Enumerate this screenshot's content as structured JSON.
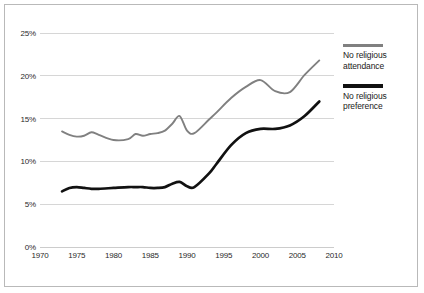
{
  "chart_data": {
    "type": "line",
    "title": "",
    "xlabel": "",
    "ylabel": "",
    "xlim": [
      1970,
      2010
    ],
    "ylim": [
      0,
      25
    ],
    "grid": true,
    "legend_position": "right",
    "x_ticks": [
      "1970",
      "1975",
      "1980",
      "1985",
      "1990",
      "1995",
      "2000",
      "2005",
      "2010"
    ],
    "y_ticks": [
      "0%",
      "5%",
      "10%",
      "15%",
      "20%",
      "25%"
    ],
    "colors": {
      "no_religious_attendance": "#808080",
      "no_religious_preference": "#111111",
      "gridline": "#cccccc",
      "border": "#b9b9b9",
      "background": "#ffffff"
    },
    "x": [
      1973,
      1974,
      1975,
      1976,
      1977,
      1978,
      1980,
      1982,
      1983,
      1984,
      1985,
      1986,
      1987,
      1988,
      1989,
      1990,
      1991,
      1993,
      1994,
      1996,
      1998,
      2000,
      2002,
      2004,
      2006,
      2008
    ],
    "series": [
      {
        "name": "No religious attendance",
        "color": "#808080",
        "values": [
          13.5,
          13.1,
          12.9,
          13.0,
          13.4,
          13.1,
          12.5,
          12.6,
          13.2,
          13.0,
          13.2,
          13.3,
          13.6,
          14.4,
          15.3,
          13.6,
          13.3,
          14.9,
          15.7,
          17.4,
          18.7,
          19.5,
          18.2,
          18.1,
          20.1,
          21.8
        ]
      },
      {
        "name": "No religious preference",
        "color": "#111111",
        "values": [
          6.5,
          6.9,
          7.0,
          6.9,
          6.8,
          6.8,
          6.9,
          7.0,
          7.0,
          7.0,
          6.9,
          6.9,
          7.0,
          7.4,
          7.6,
          7.1,
          7.0,
          8.6,
          9.7,
          11.9,
          13.3,
          13.8,
          13.8,
          14.2,
          15.3,
          17.0
        ]
      }
    ]
  },
  "legend": {
    "items": [
      {
        "label_line1": "No religious",
        "label_line2": "attendance",
        "color": "#808080"
      },
      {
        "label_line1": "No religious",
        "label_line2": "preference",
        "color": "#111111"
      }
    ]
  },
  "axis": {
    "y_ticks": [
      {
        "label": "25%",
        "value": 25
      },
      {
        "label": "20%",
        "value": 20
      },
      {
        "label": "15%",
        "value": 15
      },
      {
        "label": "10%",
        "value": 10
      },
      {
        "label": "5%",
        "value": 5
      },
      {
        "label": "0%",
        "value": 0
      }
    ],
    "x_ticks": [
      {
        "label": "1970",
        "value": 1970
      },
      {
        "label": "1975",
        "value": 1975
      },
      {
        "label": "1980",
        "value": 1980
      },
      {
        "label": "1985",
        "value": 1985
      },
      {
        "label": "1990",
        "value": 1990
      },
      {
        "label": "1995",
        "value": 1995
      },
      {
        "label": "2000",
        "value": 2000
      },
      {
        "label": "2005",
        "value": 2005
      },
      {
        "label": "2010",
        "value": 2010
      }
    ]
  }
}
